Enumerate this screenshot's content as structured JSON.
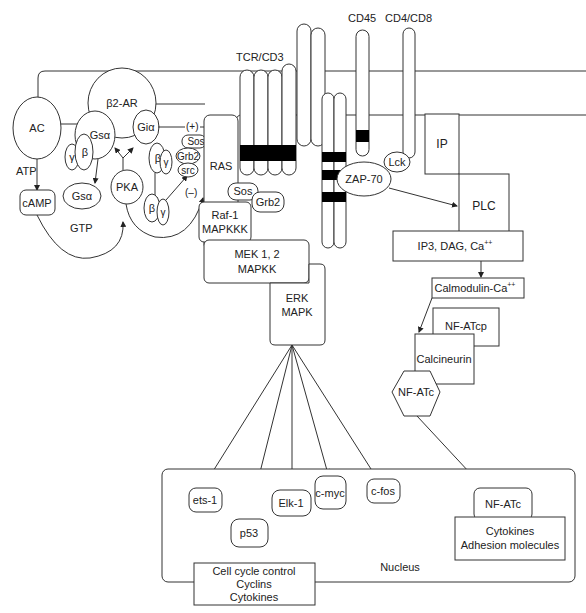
{
  "diagram": {
    "receptors": {
      "tcr_cd3": "TCR/CD3",
      "cd45": "CD45",
      "cd4_cd8": "CD4/CD8",
      "b2ar": "β2-AR"
    },
    "left_pathway": {
      "ac": "AC",
      "atp": "ATP",
      "camp": "cAMP",
      "gtp": "GTP",
      "gs_alpha": "Gsα",
      "gs_alpha_free": "Gsα",
      "gi_alpha": "Giα",
      "beta": "β",
      "gamma": "γ",
      "pka": "PKA",
      "plus": "(+)",
      "minus": "(–)",
      "sos": "Sos",
      "grb2": "Grb2",
      "src": "src"
    },
    "ras_pathway": {
      "ras": "RAS",
      "sos": "Sos",
      "grb2": "Grb2",
      "raf1_line1": "Raf-1",
      "raf1_line2": "MAPKKK",
      "mek_line1": "MEK 1, 2",
      "mek_line2": "MAPKK",
      "erk_line1": "ERK",
      "erk_line2": "MAPK"
    },
    "plc_pathway": {
      "lck": "Lck",
      "zap70": "ZAP-70",
      "ip": "IP",
      "plc": "PLC",
      "second_messengers": "IP3, DAG, Ca",
      "second_messengers_sup": "++",
      "calmodulin": "Calmodulin-Ca",
      "calmodulin_sup": "++",
      "nfatcp": "NF-ATcp",
      "calcineurin": "Calcineurin",
      "nfatc": "NF-ATc"
    },
    "nucleus": {
      "label": "Nucleus",
      "ets1": "ets-1",
      "p53": "p53",
      "elk1": "Elk-1",
      "cmyc": "c-myc",
      "cfos": "c-fos",
      "nfatc": "NF-ATc",
      "outputs_left": [
        "Cell cycle control",
        "Cyclins",
        "Cytokines"
      ],
      "outputs_right": [
        "Cytokines",
        "Adhesion molecules"
      ]
    }
  },
  "colors": {
    "stroke": "#333333",
    "fill": "#ffffff",
    "band": "#000000",
    "text": "#222222"
  }
}
